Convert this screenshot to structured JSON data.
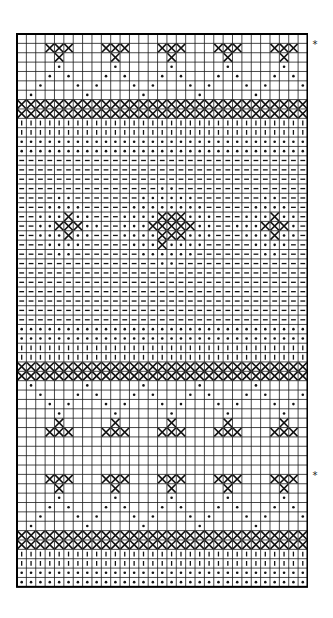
{
  "chart": {
    "title": "",
    "cols": 31,
    "rows": 59,
    "cell": 9.37,
    "grid_color": "#1a1a1a",
    "ink_color": "#111111",
    "legend": {
      "x": "cross-stitch / contrast color",
      "dot": "dot symbol",
      "bar": "vertical bar symbol",
      "dash": "dash symbol",
      "blank": "background"
    }
  },
  "markers": [
    {
      "label": "*",
      "row": 1
    },
    {
      "label": "*",
      "row": 47
    }
  ],
  "rows": [
    {
      "type": "blank"
    },
    {
      "type": "motif",
      "cells": {
        "x": [
          3,
          4,
          5,
          9,
          10,
          11,
          15,
          16,
          17,
          21,
          22,
          23,
          27,
          28,
          29
        ]
      }
    },
    {
      "type": "motif",
      "cells": {
        "x": [
          4,
          10,
          16,
          22,
          28
        ]
      }
    },
    {
      "type": "motif",
      "cells": {
        "dot": [
          4,
          10,
          16,
          22,
          28
        ]
      }
    },
    {
      "type": "motif",
      "cells": {
        "dot": [
          3,
          5,
          9,
          11,
          15,
          17,
          21,
          23,
          27,
          29
        ]
      }
    },
    {
      "type": "motif",
      "cells": {
        "dot": [
          2,
          6,
          8,
          12,
          14,
          18,
          20,
          24,
          26,
          30
        ]
      }
    },
    {
      "type": "motif",
      "cells": {
        "dot": [
          1,
          7,
          13,
          19,
          25
        ]
      }
    },
    {
      "type": "fill",
      "symbol": "x"
    },
    {
      "type": "fill",
      "symbol": "x"
    },
    {
      "type": "fill",
      "symbol": "bar"
    },
    {
      "type": "fill",
      "symbol": "bar"
    },
    {
      "type": "fill",
      "symbol": "dot"
    },
    {
      "type": "fill",
      "symbol": "dot"
    },
    {
      "type": "fill",
      "symbol": "dash"
    },
    {
      "type": "fill",
      "symbol": "dash"
    },
    {
      "type": "fill",
      "symbol": "dash"
    },
    {
      "type": "field",
      "base": "dash",
      "dots": [
        15,
        16
      ]
    },
    {
      "type": "field",
      "base": "dash",
      "dots": [
        4,
        5,
        13,
        14,
        15,
        16,
        17,
        18,
        26,
        27
      ]
    },
    {
      "type": "field",
      "base": "dash",
      "dots": [
        3,
        4,
        5,
        6,
        12,
        13,
        14,
        15,
        16,
        17,
        18,
        19,
        25,
        26,
        27,
        28
      ]
    },
    {
      "type": "field",
      "base": "dash",
      "dots": [
        2,
        3,
        4,
        6,
        7,
        11,
        12,
        13,
        14,
        18,
        19,
        20,
        24,
        25,
        26,
        28,
        29
      ],
      "x": [
        5,
        15,
        16,
        17,
        27
      ]
    },
    {
      "type": "field",
      "base": "dash",
      "dots": [
        2,
        3,
        7,
        8,
        11,
        12,
        13,
        19,
        20,
        23,
        24,
        25,
        29
      ],
      "x": [
        4,
        5,
        6,
        14,
        15,
        16,
        17,
        18,
        26,
        27,
        28
      ]
    },
    {
      "type": "field",
      "base": "dash",
      "dots": [
        2,
        3,
        4,
        6,
        7,
        11,
        12,
        13,
        14,
        18,
        19,
        20,
        24,
        25,
        26,
        28,
        29
      ],
      "x": [
        5,
        15,
        16,
        17,
        27
      ]
    },
    {
      "type": "field",
      "base": "dash",
      "dots": [
        3,
        4,
        5,
        6,
        12,
        13,
        14,
        16,
        17,
        18,
        19,
        25,
        26,
        27,
        28
      ],
      "x": [
        15
      ]
    },
    {
      "type": "field",
      "base": "dash",
      "dots": [
        4,
        5,
        13,
        14,
        15,
        16,
        17,
        18,
        26,
        27
      ]
    },
    {
      "type": "field",
      "base": "dash",
      "dots": [
        15,
        16
      ]
    },
    {
      "type": "fill",
      "symbol": "dash"
    },
    {
      "type": "fill",
      "symbol": "dash"
    },
    {
      "type": "fill",
      "symbol": "dash"
    },
    {
      "type": "fill",
      "symbol": "dash"
    },
    {
      "type": "fill",
      "symbol": "dash"
    },
    {
      "type": "fill",
      "symbol": "dash"
    },
    {
      "type": "fill",
      "symbol": "dot"
    },
    {
      "type": "fill",
      "symbol": "dot"
    },
    {
      "type": "fill",
      "symbol": "bar"
    },
    {
      "type": "fill",
      "symbol": "bar"
    },
    {
      "type": "fill",
      "symbol": "x"
    },
    {
      "type": "fill",
      "symbol": "x"
    },
    {
      "type": "motif",
      "cells": {
        "dot": [
          1,
          7,
          13,
          19,
          25
        ]
      }
    },
    {
      "type": "motif",
      "cells": {
        "dot": [
          2,
          6,
          8,
          12,
          14,
          18,
          20,
          24,
          26,
          30
        ]
      }
    },
    {
      "type": "motif",
      "cells": {
        "dot": [
          3,
          5,
          9,
          11,
          15,
          17,
          21,
          23,
          27,
          29
        ]
      }
    },
    {
      "type": "motif",
      "cells": {
        "dot": [
          4,
          10,
          16,
          22,
          28
        ]
      }
    },
    {
      "type": "motif",
      "cells": {
        "x": [
          4,
          10,
          16,
          22,
          28
        ]
      }
    },
    {
      "type": "motif",
      "cells": {
        "x": [
          3,
          4,
          5,
          9,
          10,
          11,
          15,
          16,
          17,
          21,
          22,
          23,
          27,
          28,
          29
        ]
      }
    },
    {
      "type": "blank"
    },
    {
      "type": "blank"
    },
    {
      "type": "blank"
    },
    {
      "type": "blank"
    },
    {
      "type": "motif",
      "cells": {
        "x": [
          3,
          4,
          5,
          9,
          10,
          11,
          15,
          16,
          17,
          21,
          22,
          23,
          27,
          28,
          29
        ]
      }
    },
    {
      "type": "motif",
      "cells": {
        "x": [
          4,
          10,
          16,
          22,
          28
        ]
      }
    },
    {
      "type": "motif",
      "cells": {
        "dot": [
          4,
          10,
          16,
          22,
          28
        ]
      }
    },
    {
      "type": "motif",
      "cells": {
        "dot": [
          3,
          5,
          9,
          11,
          15,
          17,
          21,
          23,
          27,
          29
        ]
      }
    },
    {
      "type": "motif",
      "cells": {
        "dot": [
          2,
          6,
          8,
          12,
          14,
          18,
          20,
          24,
          26,
          30
        ]
      }
    },
    {
      "type": "motif",
      "cells": {
        "dot": [
          1,
          7,
          13,
          19,
          25
        ]
      }
    },
    {
      "type": "fill",
      "symbol": "x"
    },
    {
      "type": "fill",
      "symbol": "x"
    },
    {
      "type": "fill",
      "symbol": "bar"
    },
    {
      "type": "fill",
      "symbol": "bar"
    },
    {
      "type": "fill",
      "symbol": "dot"
    },
    {
      "type": "fill",
      "symbol": "dot"
    }
  ]
}
